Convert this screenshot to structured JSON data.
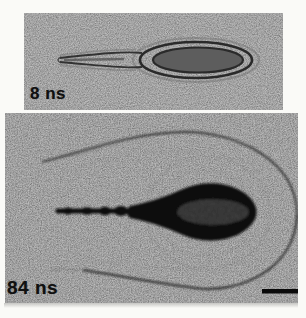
{
  "figure": {
    "type": "experiment-photo-sequence",
    "frames": [
      {
        "time_label": "8 ns"
      },
      {
        "time_label": "84 ns"
      }
    ],
    "scale_bar": {
      "present": true,
      "label": ""
    },
    "colors": {
      "page_bg": "#fafaf7",
      "photo_bg_top": "#aaaaaa",
      "photo_bg_bottom": "#a7a7a7",
      "plasma_dark": "#121212",
      "contour_dark": "#262626",
      "label_text": "#101010"
    }
  }
}
